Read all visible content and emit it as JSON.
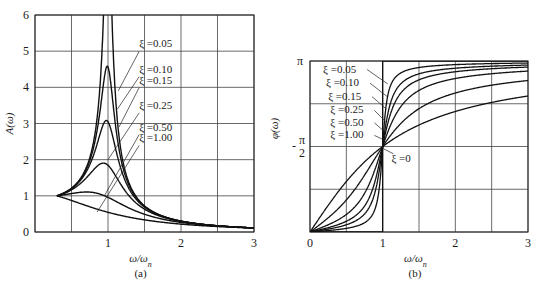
{
  "chart_data": [
    {
      "id": "a",
      "type": "line",
      "title": "",
      "caption": "(a)",
      "xlabel": "ω/ω_n",
      "xlabel_main": "ω/ω",
      "xlabel_sub": "n",
      "ylabel": "A(ω)",
      "xlim": [
        0,
        3
      ],
      "ylim": [
        0,
        6
      ],
      "x_ticks": [
        "1",
        "2",
        "3"
      ],
      "x_tick_values": [
        1,
        2,
        3
      ],
      "y_ticks": [
        "0",
        "1",
        "2",
        "3",
        "4",
        "5",
        "6"
      ],
      "grid": true,
      "x_grid_step": 0.5,
      "y_grid_step": 1,
      "series": [
        {
          "name": "ξ=0.05",
          "zeta": 0.05,
          "peak": 10.0
        },
        {
          "name": "ξ=0.10",
          "zeta": 0.1,
          "peak": 5.0
        },
        {
          "name": "ξ=0.15",
          "zeta": 0.15,
          "peak": 3.3
        },
        {
          "name": "ξ=0.25",
          "zeta": 0.25,
          "peak": 2.0
        },
        {
          "name": "ξ=0.50",
          "zeta": 0.5,
          "peak": 1.15
        },
        {
          "name": "ξ=1.00",
          "zeta": 1.0,
          "peak": 1.0
        }
      ],
      "x_start": 0.3,
      "annotations": [
        {
          "text": "ξ =0.05",
          "label_xy": [
            1.4,
            5.05
          ],
          "point_xy": [
            1.14,
            3.9
          ]
        },
        {
          "text": "ξ =0.10",
          "label_xy": [
            1.4,
            4.35
          ],
          "point_xy": [
            1.13,
            3.4
          ]
        },
        {
          "text": "ξ =0.15",
          "label_xy": [
            1.4,
            4.05
          ],
          "point_xy": [
            1.15,
            2.9
          ]
        },
        {
          "text": "ξ =0.25",
          "label_xy": [
            1.4,
            3.35
          ],
          "point_xy": [
            1.0,
            2.0
          ]
        },
        {
          "text": "ξ =0.50",
          "label_xy": [
            1.4,
            2.75
          ],
          "point_xy": [
            0.95,
            1.0
          ]
        },
        {
          "text": "ξ =1.00",
          "label_xy": [
            1.4,
            2.45
          ],
          "point_xy": [
            0.85,
            0.55
          ]
        }
      ]
    },
    {
      "id": "b",
      "type": "line",
      "title": "",
      "caption": "(b)",
      "xlabel": "ω/ω_n",
      "xlabel_main": "ω/ω",
      "xlabel_sub": "n",
      "ylabel": "φ(ω)",
      "xlim": [
        0,
        3
      ],
      "ylim": [
        0,
        3.14159
      ],
      "x_ticks": [
        "0",
        "1",
        "2",
        "3"
      ],
      "x_tick_values": [
        0,
        1,
        2,
        3
      ],
      "y_ticks": [
        "π/2",
        "π"
      ],
      "y_tick_labels": {
        "pi": "π",
        "half_num": "π",
        "half_den": "2",
        "minus": "-"
      },
      "grid": true,
      "x_grid_step": 0.5,
      "y_grid_step": 0.7854,
      "series": [
        {
          "name": "ξ=0.05",
          "zeta": 0.05
        },
        {
          "name": "ξ=0.10",
          "zeta": 0.1
        },
        {
          "name": "ξ=0.15",
          "zeta": 0.15
        },
        {
          "name": "ξ=0.25",
          "zeta": 0.25
        },
        {
          "name": "ξ=0.50",
          "zeta": 0.5
        },
        {
          "name": "ξ=1.00",
          "zeta": 1.0
        },
        {
          "name": "ξ=0",
          "zeta": 0.0
        }
      ],
      "annotations": [
        {
          "text": "ξ =0.05",
          "label_xy": [
            0.18,
            2.93
          ],
          "point_xy": [
            1.07,
            2.72
          ]
        },
        {
          "text": "ξ =0.10",
          "label_xy": [
            0.22,
            2.68
          ],
          "point_xy": [
            1.06,
            2.49
          ]
        },
        {
          "text": "ξ =0.15",
          "label_xy": [
            0.25,
            2.43
          ],
          "point_xy": [
            1.05,
            2.26
          ]
        },
        {
          "text": "ξ =0.25",
          "label_xy": [
            0.28,
            2.18
          ],
          "point_xy": [
            1.04,
            2.03
          ]
        },
        {
          "text": "ξ =0.50",
          "label_xy": [
            0.28,
            1.95
          ],
          "point_xy": [
            1.03,
            1.84
          ]
        },
        {
          "text": "ξ =1.00",
          "label_xy": [
            0.28,
            1.72
          ],
          "point_xy": [
            1.02,
            1.69
          ]
        },
        {
          "text": "ξ =0",
          "label_xy": [
            1.12,
            1.29
          ],
          "point_xy": [
            1.01,
            1.53
          ]
        }
      ]
    }
  ],
  "captions": {
    "a": "(a)",
    "b": "(b)"
  }
}
